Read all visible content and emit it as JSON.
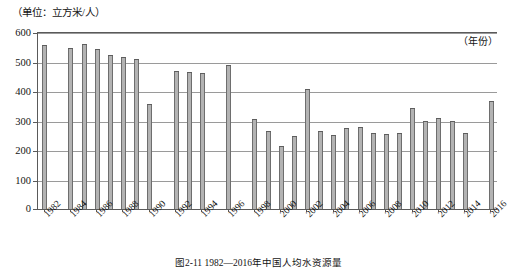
{
  "unit_label": "（单位：立方米/人）",
  "caption": "图2-11  1982—2016年中国人均水资源量",
  "axis": {
    "x_title": "（年份）",
    "y_ticks": [
      "0",
      "100",
      "200",
      "300",
      "400",
      "500",
      "600"
    ],
    "x_tick_labels": [
      "1982",
      "1984",
      "1986",
      "1988",
      "1990",
      "1992",
      "1994",
      "1996",
      "1998",
      "2000",
      "2002",
      "2004",
      "2006",
      "2008",
      "2010",
      "2012",
      "2014",
      "2016"
    ]
  },
  "colors": {
    "bar_fill": "#b3b3b3",
    "bar_edge": "#6e6e6e",
    "gridline": "#9a9a9a",
    "axis": "#5a5a5a",
    "text": "#141414",
    "background": "#ffffff"
  },
  "chart_data": {
    "type": "bar",
    "title": "图2-11  1982—2016年中国人均水资源量",
    "xlabel": "（年份）",
    "ylabel": "（单位：立方米/人）",
    "ylim": [
      0,
      600
    ],
    "ytick_step": 100,
    "grid": true,
    "legend": "none",
    "categories": [
      "1982",
      "1983",
      "1984",
      "1985",
      "1986",
      "1987",
      "1988",
      "1989",
      "1990",
      "1991",
      "1992",
      "1993",
      "1994",
      "1995",
      "1996",
      "1997",
      "1998",
      "1999",
      "2000",
      "2001",
      "2002",
      "2003",
      "2004",
      "2005",
      "2006",
      "2007",
      "2008",
      "2009",
      "2010",
      "2011",
      "2012",
      "2013",
      "2014",
      "2015",
      "2016"
    ],
    "values": [
      557,
      0,
      546,
      559,
      541,
      521,
      515,
      510,
      356,
      0,
      469,
      463,
      460,
      0,
      489,
      0,
      306,
      264,
      214,
      248,
      408,
      264,
      251,
      276,
      277,
      257,
      254,
      258,
      344,
      297,
      310,
      299,
      259,
      0,
      367
    ],
    "series": [
      {
        "name": "人均水资源量",
        "unit": "立方米/人",
        "values": [
          557,
          0,
          546,
          559,
          541,
          521,
          515,
          510,
          356,
          0,
          469,
          463,
          460,
          0,
          489,
          0,
          306,
          264,
          214,
          248,
          408,
          264,
          251,
          276,
          277,
          257,
          254,
          258,
          344,
          297,
          310,
          299,
          259,
          0,
          367
        ]
      }
    ]
  }
}
